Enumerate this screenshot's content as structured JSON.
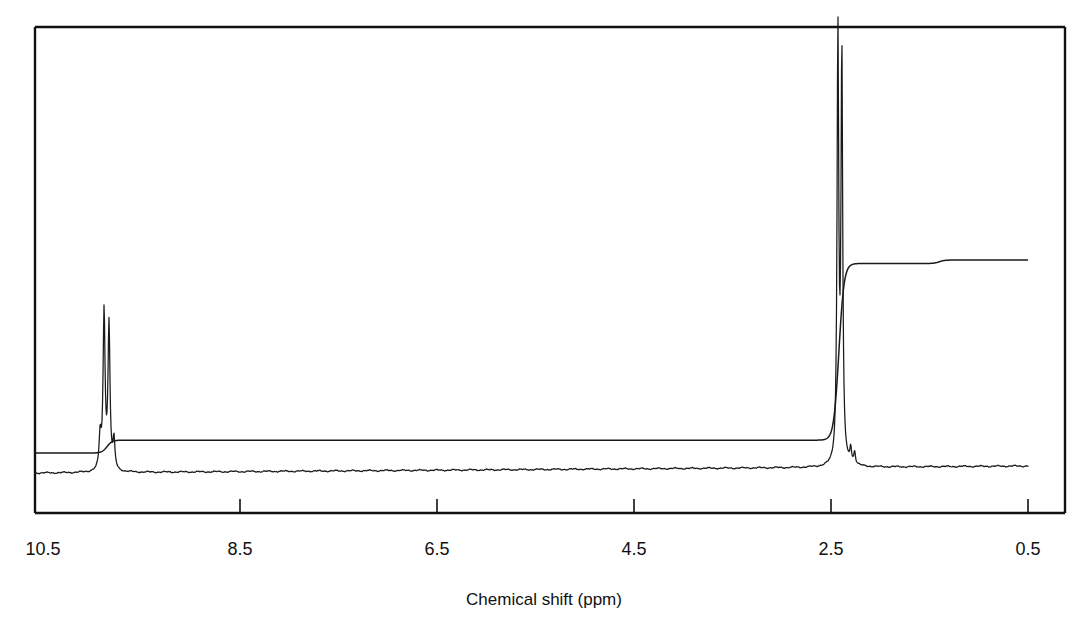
{
  "figure": {
    "kind": "nmr-spectrum",
    "background_color": "#ffffff",
    "trace_color": "#1a1a1a",
    "frame_color": "#111111"
  },
  "axis": {
    "title": "Chemical shift (ppm)",
    "tick_labels": [
      "10.5",
      "8.5",
      "6.5",
      "4.5",
      "2.5",
      "0.5"
    ],
    "direction_note": "decreasing left to right"
  },
  "chart_data": {
    "type": "line",
    "title": "",
    "subtitle": "",
    "xlabel": "Chemical shift (ppm)",
    "ylabel": "",
    "xlim": [
      10.5,
      0.5
    ],
    "ylim": [
      0,
      1
    ],
    "grid": false,
    "legend": "none",
    "reversed_x_axis": true,
    "x_ticks": [
      10.5,
      8.5,
      6.5,
      4.5,
      2.5,
      0.5
    ],
    "x_tick_labels": [
      "10.5",
      "8.5",
      "6.5",
      "4.5",
      "2.5",
      "0.5"
    ],
    "series": [
      {
        "name": "1H NMR trace",
        "type": "spectrum",
        "peaks": [
          {
            "label": "aldehyde CHO",
            "ppm": 9.88,
            "relative_height": 0.36,
            "width_ppm": 0.012,
            "multiplicity": "d"
          },
          {
            "label": "aldehyde CHO",
            "ppm": 9.83,
            "relative_height": 0.33,
            "width_ppm": 0.012,
            "multiplicity": "d"
          },
          {
            "label": "aldehyde shoulder",
            "ppm": 9.92,
            "relative_height": 0.075,
            "width_ppm": 0.012,
            "multiplicity": "m"
          },
          {
            "label": "aldehyde shoulder",
            "ppm": 9.78,
            "relative_height": 0.065,
            "width_ppm": 0.012,
            "multiplicity": "m"
          },
          {
            "label": "methyl CH3",
            "ppm": 2.43,
            "relative_height": 0.98,
            "width_ppm": 0.01,
            "multiplicity": "s"
          },
          {
            "label": "methyl CH3 satellite",
            "ppm": 2.39,
            "relative_height": 0.93,
            "width_ppm": 0.01,
            "multiplicity": "s"
          },
          {
            "label": "minor impurity",
            "ppm": 2.3,
            "relative_height": 0.035,
            "width_ppm": 0.01,
            "multiplicity": "m"
          },
          {
            "label": "minor impurity",
            "ppm": 2.26,
            "relative_height": 0.028,
            "width_ppm": 0.01,
            "multiplicity": "m"
          }
        ],
        "baseline_note": "gently rising baseline from left to right"
      },
      {
        "name": "integration curve",
        "type": "step",
        "steps": [
          {
            "at_ppm": 9.85,
            "rise_fraction": 0.045,
            "assignment": "1H (CHO)"
          },
          {
            "at_ppm": 2.42,
            "rise_fraction": 0.62,
            "assignment": "3H (CH3)"
          },
          {
            "at_ppm": 1.4,
            "rise_fraction": 0.012,
            "assignment": "residual"
          }
        ]
      }
    ],
    "annotations": []
  }
}
